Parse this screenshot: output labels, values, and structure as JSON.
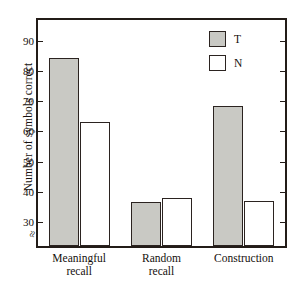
{
  "chart_data": {
    "type": "bar",
    "title": "",
    "xlabel": "",
    "ylabel": "Number of symbols correct",
    "categories": [
      "Meaningful recall",
      "Random recall",
      "Construction"
    ],
    "category_lines": [
      [
        "Meaningful",
        "recall"
      ],
      [
        "Random",
        "recall"
      ],
      [
        "Construction"
      ]
    ],
    "series": [
      {
        "name": "T",
        "values": [
          84.5,
          36.5,
          68.5
        ],
        "color": "#c9c9c4"
      },
      {
        "name": "N",
        "values": [
          63.0,
          38.0,
          37.0
        ],
        "color": "#ffffff"
      }
    ],
    "ylim": [
      22,
      97
    ],
    "yticks": [
      30,
      40,
      50,
      60,
      70,
      80,
      90
    ],
    "ytick_labels": [
      "30",
      "40",
      "50",
      "60",
      "70",
      "80",
      "90"
    ],
    "axis_break": "≈",
    "grid": false,
    "legend_position": "top-right",
    "legend": [
      "T",
      "N"
    ]
  },
  "axis": {
    "y_title": "Number of symbols correct"
  },
  "legend": {
    "items": [
      {
        "label": "T"
      },
      {
        "label": "N"
      }
    ]
  }
}
